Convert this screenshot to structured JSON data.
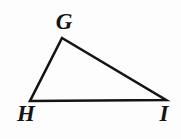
{
  "figure": {
    "kind": "triangle-diagram",
    "name": "Triangle GHI",
    "background_color": "#fdfdfd",
    "stroke_color": "#141414",
    "stroke_width": 2.6,
    "canvas": {
      "width": 181,
      "height": 139
    }
  },
  "vertices": [
    {
      "id": "G",
      "label": "G",
      "x": 62,
      "y": 38,
      "label_x": 64,
      "label_y": 21
    },
    {
      "id": "H",
      "label": "H",
      "x": 30,
      "y": 101,
      "label_x": 26,
      "label_y": 113
    },
    {
      "id": "I",
      "label": "I",
      "x": 166,
      "y": 100,
      "label_x": 164,
      "label_y": 113
    }
  ],
  "edges": [
    {
      "id": "GH",
      "from": "G",
      "to": "H"
    },
    {
      "id": "HI",
      "from": "H",
      "to": "I"
    },
    {
      "id": "IG",
      "from": "I",
      "to": "G"
    }
  ],
  "chart_data": {
    "type": "scatter",
    "title": "",
    "xlabel": "",
    "ylabel": "",
    "point_labels": [
      "G",
      "H",
      "I"
    ],
    "x": [
      62,
      30,
      166
    ],
    "y": [
      38,
      101,
      100
    ],
    "polygon_closed": true,
    "grid": false,
    "legend": null
  }
}
